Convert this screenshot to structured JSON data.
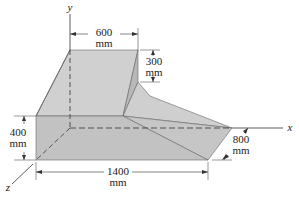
{
  "figure": {
    "axes": {
      "x": "x",
      "y": "y",
      "z": "z"
    },
    "dimensions": [
      {
        "id": "top_width",
        "value": "600",
        "unit": "mm"
      },
      {
        "id": "step_height",
        "value": "300",
        "unit": "mm"
      },
      {
        "id": "block_height",
        "value": "400",
        "unit": "mm"
      },
      {
        "id": "length",
        "value": "1400",
        "unit": "mm"
      },
      {
        "id": "depth",
        "value": "800",
        "unit": "mm"
      }
    ],
    "colors": {
      "face_light": "#d2d2d2",
      "face_mid": "#c4c4c4",
      "face_dark": "#b4b4b4",
      "edge": "#555555",
      "line": "#333333"
    }
  }
}
